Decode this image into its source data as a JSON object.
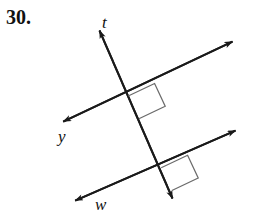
{
  "problem": {
    "number": "30."
  },
  "figure": {
    "type": "geometry-diagram",
    "background_color": "#ffffff",
    "stroke_color": "#1a1a1a",
    "right_angle_color": "#6b6b6b",
    "labels": {
      "transversal": "t",
      "upper_parallel": "y",
      "lower_parallel": "w"
    },
    "lines": [
      {
        "name": "t",
        "role": "transversal",
        "arrowheads": [
          "up",
          "down"
        ],
        "from": [
          96,
          22
        ],
        "to": [
          176,
          206
        ]
      },
      {
        "name": "y",
        "role": "parallel-line-upper",
        "arrowheads": [
          "left",
          "right"
        ],
        "from": [
          58,
          124
        ],
        "to": [
          238,
          39
        ]
      },
      {
        "name": "w",
        "role": "parallel-line-lower",
        "arrowheads": [
          "left",
          "right"
        ],
        "from": [
          70,
          203
        ],
        "to": [
          241,
          128
        ]
      }
    ],
    "intersections": [
      {
        "lines": [
          "t",
          "y"
        ],
        "point": [
          128,
          96
        ],
        "marked_right_angle": true
      },
      {
        "lines": [
          "t",
          "w"
        ],
        "point": [
          161,
          168
        ],
        "marked_right_angle": true
      }
    ],
    "right_angle_marks": 2
  }
}
